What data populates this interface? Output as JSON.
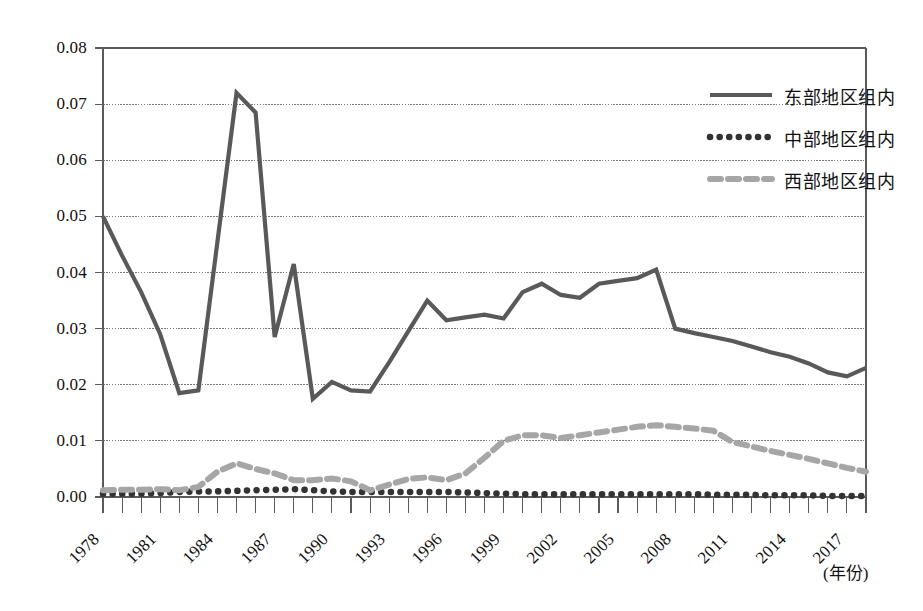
{
  "chart_data": {
    "type": "line",
    "title": "",
    "subtitle": "",
    "xlabel": "(年份)",
    "ylabel": "",
    "grid": true,
    "legend_position": "top-right",
    "xlim": [
      1978,
      2018
    ],
    "ylim": [
      0.0,
      0.08
    ],
    "y_ticks": [
      "0.00",
      "0.01",
      "0.02",
      "0.03",
      "0.04",
      "0.05",
      "0.06",
      "0.07",
      "0.08"
    ],
    "y_tick_values": [
      0.0,
      0.01,
      0.02,
      0.03,
      0.04,
      0.05,
      0.06,
      0.07,
      0.08
    ],
    "x_tick_labels": [
      "1978",
      "1981",
      "1984",
      "1987",
      "1990",
      "1993",
      "1996",
      "1999",
      "2002",
      "2005",
      "2008",
      "2011",
      "2014",
      "2017"
    ],
    "x_tick_values": [
      1978,
      1981,
      1984,
      1987,
      1990,
      1993,
      1996,
      1999,
      2002,
      2005,
      2008,
      2011,
      2014,
      2017
    ],
    "x": [
      1978,
      1979,
      1980,
      1981,
      1982,
      1983,
      1984,
      1985,
      1986,
      1987,
      1988,
      1989,
      1990,
      1991,
      1992,
      1993,
      1994,
      1995,
      1996,
      1997,
      1998,
      1999,
      2000,
      2001,
      2002,
      2003,
      2004,
      2005,
      2006,
      2007,
      2008,
      2009,
      2010,
      2011,
      2012,
      2013,
      2014,
      2015,
      2016,
      2017,
      2018
    ],
    "series": [
      {
        "name": "东部地区组内",
        "style": "solid",
        "color": "#595959",
        "values": [
          0.05,
          0.043,
          0.0365,
          0.029,
          0.0185,
          0.019,
          0.0455,
          0.072,
          0.0685,
          0.0285,
          0.0415,
          0.0175,
          0.0205,
          0.019,
          0.0188,
          0.024,
          0.0295,
          0.035,
          0.0315,
          0.032,
          0.0325,
          0.0318,
          0.0365,
          0.038,
          0.036,
          0.0355,
          0.038,
          0.0385,
          0.039,
          0.0405,
          0.03,
          0.0292,
          0.0285,
          0.0278,
          0.0268,
          0.0258,
          0.025,
          0.0238,
          0.0222,
          0.0215,
          0.023
        ]
      },
      {
        "name": "中部地区组内",
        "style": "dotted",
        "color": "#333333",
        "values": [
          0.0006,
          0.0006,
          0.0006,
          0.0007,
          0.0009,
          0.001,
          0.001,
          0.0011,
          0.0012,
          0.0013,
          0.0014,
          0.0012,
          0.001,
          0.0009,
          0.0009,
          0.0009,
          0.0009,
          0.0009,
          0.0009,
          0.0008,
          0.0007,
          0.0006,
          0.0005,
          0.0005,
          0.0005,
          0.0005,
          0.0005,
          0.0005,
          0.0005,
          0.0005,
          0.0005,
          0.0005,
          0.0004,
          0.0004,
          0.0004,
          0.0003,
          0.0003,
          0.0003,
          0.0002,
          0.0002,
          0.0002
        ]
      },
      {
        "name": "西部地区组内",
        "style": "dashed",
        "color": "#a6a6a6",
        "values": [
          0.0012,
          0.0013,
          0.0013,
          0.0014,
          0.0012,
          0.0018,
          0.0045,
          0.006,
          0.005,
          0.0042,
          0.003,
          0.003,
          0.0033,
          0.0028,
          0.0012,
          0.0022,
          0.0032,
          0.0035,
          0.003,
          0.0042,
          0.007,
          0.01,
          0.011,
          0.011,
          0.0105,
          0.011,
          0.0115,
          0.012,
          0.0125,
          0.0128,
          0.0125,
          0.0122,
          0.0118,
          0.0098,
          0.009,
          0.0082,
          0.0075,
          0.0068,
          0.006,
          0.0052,
          0.0045
        ]
      }
    ]
  },
  "legend": {
    "items": [
      {
        "label": "东部地区组内",
        "style": "solid",
        "color": "#595959"
      },
      {
        "label": "中部地区组内",
        "style": "dotted",
        "color": "#333333"
      },
      {
        "label": "西部地区组内",
        "style": "dashed",
        "color": "#a6a6a6"
      }
    ]
  },
  "axis": {
    "x_unit_label": "(年份)"
  },
  "colors": {
    "east": "#595959",
    "central": "#333333",
    "west": "#a6a6a6",
    "grid": "#7a7a7a",
    "frame": "#5a5a5a",
    "text": "#111111"
  }
}
